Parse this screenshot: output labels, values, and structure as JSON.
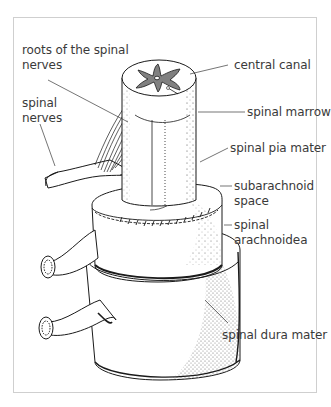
{
  "figure": {
    "type": "anatomical-illustration",
    "labels": [
      {
        "id": "roots",
        "line1": "roots of the spinal",
        "line2": "nerves"
      },
      {
        "id": "spinal_nerves",
        "line1": "spinal",
        "line2": "nerves"
      },
      {
        "id": "central_canal",
        "line1": "central canal"
      },
      {
        "id": "spinal_marrow",
        "line1": "spinal marrow"
      },
      {
        "id": "pia_mater",
        "line1": "spinal pia mater"
      },
      {
        "id": "subarachnoid",
        "line1": "subarachnoid",
        "line2": "space"
      },
      {
        "id": "arachnoidea",
        "line1": "spinal",
        "line2": "arachnoidea"
      },
      {
        "id": "dura_mater",
        "line1": "spinal dura mater"
      }
    ]
  },
  "colors": {
    "frame": "#cfcfcf",
    "text": "#3a3a3a",
    "ink": "#1a1a1a",
    "grey_matter": "#808080"
  }
}
